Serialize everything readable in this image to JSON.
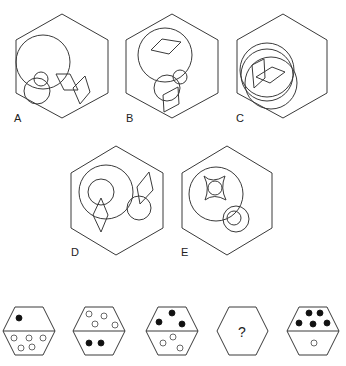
{
  "header": {
    "title_partial": "...g..."
  },
  "options_panel": {
    "options": [
      {
        "label": "A",
        "description": "Large circle with two small circles and two overlapping rhombi"
      },
      {
        "label": "B",
        "description": "Large circle containing rhombus with two small circles and a rhombus below"
      },
      {
        "label": "C",
        "description": "Three overlapping circles with two rhombi"
      },
      {
        "label": "D",
        "description": "Concentric circles with rhombus, separate circle and rhombus"
      },
      {
        "label": "E",
        "description": "Large circle with four-pointed star and concentric small circles"
      }
    ]
  },
  "sequence_panel": {
    "items": [
      {
        "index": 1,
        "top": {
          "filled": 1,
          "empty": 0
        },
        "bottom": {
          "filled": 0,
          "empty": 5
        }
      },
      {
        "index": 2,
        "top": {
          "filled": 0,
          "empty": 4
        },
        "bottom": {
          "filled": 2,
          "empty": 0
        }
      },
      {
        "index": 3,
        "top": {
          "filled": 3,
          "empty": 0
        },
        "bottom": {
          "filled": 0,
          "empty": 3
        }
      },
      {
        "index": 4,
        "unknown": true,
        "symbol": "?"
      },
      {
        "index": 5,
        "top": {
          "filled": 5,
          "empty": 0
        },
        "bottom": {
          "filled": 0,
          "empty": 1
        }
      }
    ]
  },
  "colors": {
    "stroke": "#3a3a3a",
    "dot_filled": "#111111",
    "background": "#ffffff"
  }
}
